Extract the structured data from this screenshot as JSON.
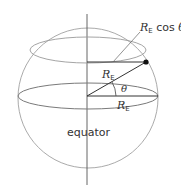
{
  "diagram": {
    "type": "sphere-latitude",
    "labels": {
      "top_right_R": "R",
      "top_right_sub": "E",
      "top_right_rest": " cos ",
      "top_right_theta": "θ",
      "radius_R": "R",
      "radius_sub": "E",
      "horizontal_R": "R",
      "horizontal_sub": "E",
      "angle": "θ",
      "equator": "equator"
    },
    "colors": {
      "sphere_outline": "#9a9a9a",
      "axis": "#555555",
      "radius_lines": "#333333",
      "point": "#111111",
      "text": "#333333"
    }
  }
}
